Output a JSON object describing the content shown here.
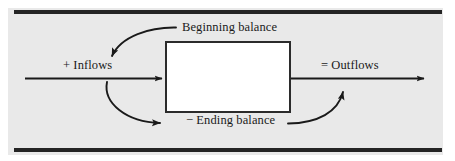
{
  "figure": {
    "type": "flow-diagram",
    "background_color": "#e9e9e9",
    "rule_color": "#242424",
    "line_color": "#1a1a1a",
    "box_fill_color": "#ffffff",
    "box_border_color": "#2b2b2b"
  },
  "labels": {
    "beginning_balance": "Beginning balance",
    "inflows": "+ Inflows",
    "outflows": "= Outflows",
    "ending_balance": "− Ending balance"
  },
  "diagram_data": {
    "type": "diagram",
    "title": "",
    "nodes": [
      {
        "id": "balance-box",
        "label": "",
        "shape": "rectangle",
        "x": 165,
        "y": 41,
        "width": 126,
        "height": 72
      }
    ],
    "labels_on_flow": [
      {
        "id": "beginning-balance",
        "text": "Beginning balance",
        "x": 182,
        "y": 20
      },
      {
        "id": "inflows",
        "text": "+ Inflows",
        "x": 63,
        "y": 58
      },
      {
        "id": "outflows",
        "text": "= Outflows",
        "x": 321,
        "y": 58
      },
      {
        "id": "ending-balance",
        "text": "− Ending balance",
        "x": 186,
        "y": 113
      }
    ],
    "edges": [
      {
        "id": "main-inflow-arrow",
        "from": "left-edge",
        "to": "balance-box",
        "style": "straight",
        "direction": "right"
      },
      {
        "id": "main-outflow-arrow",
        "from": "balance-box",
        "to": "right-edge",
        "style": "straight",
        "direction": "right"
      },
      {
        "id": "beginning-balance-curve",
        "from": "beginning-balance",
        "to": "inflows",
        "style": "curved",
        "direction": "down-left"
      },
      {
        "id": "inflows-to-ending-curve",
        "from": "inflows",
        "to": "ending-balance",
        "style": "curved",
        "direction": "down-right"
      },
      {
        "id": "ending-to-outflows-curve",
        "from": "ending-balance",
        "to": "outflows",
        "style": "curved",
        "direction": "up-right"
      }
    ]
  }
}
